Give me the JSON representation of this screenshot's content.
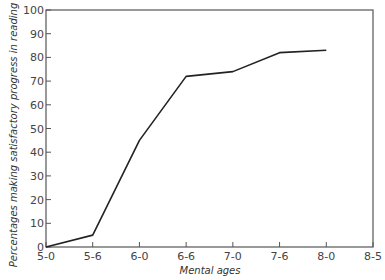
{
  "chart_data": {
    "type": "line",
    "title": "",
    "xlabel": "Mental ages",
    "ylabel": "Percentages making satisfactory progress in reading",
    "categories": [
      "5-0",
      "5-6",
      "6-0",
      "6-6",
      "7-0",
      "7-6",
      "8-0",
      "8-5"
    ],
    "series": [
      {
        "name": "Percentage making satisfactory progress",
        "x": [
          "5-0",
          "5-6",
          "6-0",
          "6-6",
          "7-0",
          "7-6",
          "8-0"
        ],
        "values": [
          0,
          5,
          45,
          72,
          74,
          82,
          83
        ]
      }
    ],
    "y_ticks": [
      0,
      10,
      20,
      30,
      40,
      50,
      60,
      70,
      80,
      90,
      100
    ],
    "ylim": [
      0,
      100
    ],
    "grid": false,
    "legend": "none",
    "colors": {
      "line": "#222222",
      "axis": "#555555"
    }
  }
}
